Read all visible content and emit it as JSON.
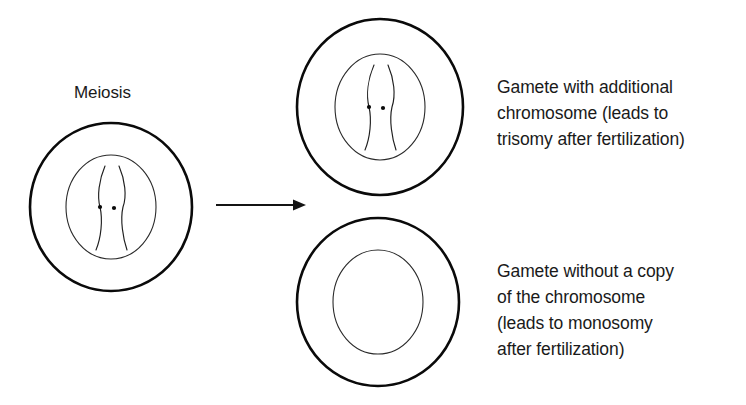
{
  "figure": {
    "background_color": "#ffffff",
    "line_color": "#000000",
    "text_color": "#1a1a1a"
  },
  "labels": {
    "meiosis": "Meiosis",
    "trisomy_caption": "Gamete with additional\nchromosome (leads to\ntrisomy after fertilization)",
    "monosomy_caption": "Gamete without a copy\nof the chromosome\n(leads to monosomy\nafter fertilization)"
  },
  "caption_lines": {
    "trisomy": [
      "Gamete with additional",
      "chromosome (leads to",
      "trisomy after fertilization)"
    ],
    "monosomy": [
      "Gamete without a copy",
      "of the chromosome",
      "(leads to monosomy",
      "after fertilization)"
    ]
  },
  "cells": [
    {
      "id": "parent-cell",
      "role": "Meiosis source cell",
      "center_x": 111,
      "center_y": 207,
      "membrane_rx": 81,
      "membrane_ry": 84,
      "nucleus_rx": 45,
      "nucleus_ry": 52,
      "chromosome_count": 2
    },
    {
      "id": "gamete-trisomy",
      "role": "Gamete with additional chromosome",
      "center_x": 380,
      "center_y": 107,
      "membrane_rx": 83,
      "membrane_ry": 88,
      "nucleus_rx": 45,
      "nucleus_ry": 53,
      "chromosome_count": 2
    },
    {
      "id": "gamete-monosomy",
      "role": "Gamete without a copy of the chromosome",
      "center_x": 378,
      "center_y": 302,
      "membrane_rx": 81,
      "membrane_ry": 84,
      "nucleus_rx": 45,
      "nucleus_ry": 52,
      "chromosome_count": 0
    }
  ],
  "arrow": {
    "x_start": 216,
    "x_end": 306,
    "y": 205,
    "direction": "right"
  }
}
